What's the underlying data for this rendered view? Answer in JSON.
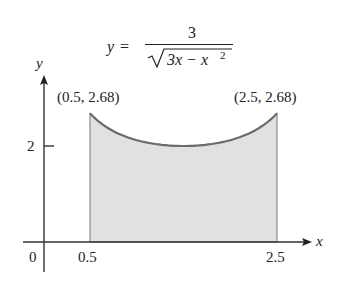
{
  "chart_data": {
    "type": "area",
    "formula": {
      "lhs": "y",
      "equals": "=",
      "numerator": "3",
      "radicand_a": "3x − x",
      "exponent": "2"
    },
    "xlabel": "x",
    "ylabel": "y",
    "x_ticks": [
      {
        "value": 0.5,
        "label": "0.5"
      },
      {
        "value": 2.5,
        "label": "2.5"
      }
    ],
    "y_ticks": [
      {
        "value": 2,
        "label": "2"
      }
    ],
    "origin_label": "0",
    "shaded_interval": [
      0.5,
      2.5
    ],
    "annotations": [
      {
        "x": 0.5,
        "y": 2.68,
        "label": "(0.5, 2.68)"
      },
      {
        "x": 2.5,
        "y": 2.68,
        "label": "(2.5, 2.68)"
      }
    ],
    "series": [
      {
        "name": "y = 3/sqrt(3x - x^2)",
        "x": [
          0.5,
          0.75,
          1.0,
          1.25,
          1.5,
          1.75,
          2.0,
          2.25,
          2.5
        ],
        "values": [
          2.68,
          2.31,
          2.12,
          2.03,
          2.0,
          2.03,
          2.12,
          2.31,
          2.68
        ]
      }
    ],
    "colors": {
      "fill": "#e0e0e0",
      "curve": "#6b6b6b",
      "axis": "#333333"
    }
  }
}
